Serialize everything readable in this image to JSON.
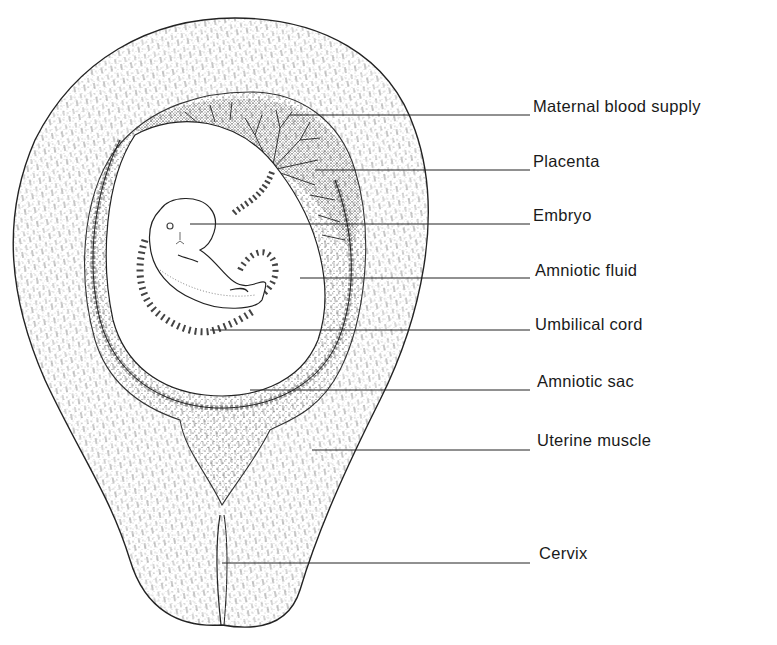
{
  "diagram": {
    "labels": [
      {
        "text": "Maternal blood supply",
        "x": 533,
        "y": 96,
        "line": {
          "x1": 290,
          "y1": 115,
          "x2": 530,
          "y2": 115
        }
      },
      {
        "text": "Placenta",
        "x": 533,
        "y": 151,
        "line": {
          "x1": 315,
          "y1": 170,
          "x2": 530,
          "y2": 170
        }
      },
      {
        "text": "Embryo",
        "x": 533,
        "y": 206,
        "line": {
          "x1": 190,
          "y1": 224,
          "x2": 530,
          "y2": 224
        }
      },
      {
        "text": "Amniotic fluid",
        "x": 535,
        "y": 261,
        "line": {
          "x1": 300,
          "y1": 278,
          "x2": 530,
          "y2": 278
        }
      },
      {
        "text": "Umbilical cord",
        "x": 535,
        "y": 315,
        "line": {
          "x1": 210,
          "y1": 330,
          "x2": 530,
          "y2": 330
        }
      },
      {
        "text": "Amniotic sac",
        "x": 537,
        "y": 372,
        "line": {
          "x1": 250,
          "y1": 390,
          "x2": 530,
          "y2": 390
        }
      },
      {
        "text": "Uterine muscle",
        "x": 537,
        "y": 430,
        "line": {
          "x1": 312,
          "y1": 450,
          "x2": 530,
          "y2": 450
        }
      },
      {
        "text": "Cervix",
        "x": 539,
        "y": 543,
        "line": {
          "x1": 222,
          "y1": 563,
          "x2": 530,
          "y2": 563
        }
      }
    ]
  }
}
